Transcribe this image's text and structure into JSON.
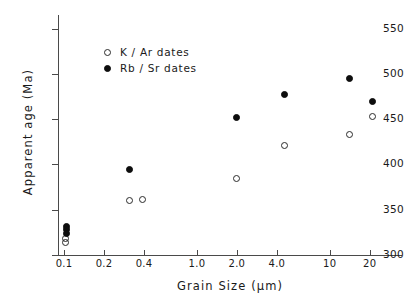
{
  "chart_data": {
    "type": "scatter",
    "title": "",
    "xlabel": "Grain Size (µm)",
    "ylabel": "Apparent age (Ma)",
    "xscale": "log",
    "yscale": "linear",
    "xlim": [
      0.09,
      35
    ],
    "ylim": [
      300,
      565
    ],
    "grid": false,
    "legend_position": "upper left",
    "xticks": [
      {
        "value": 0.1,
        "label": "0.1"
      },
      {
        "value": 0.2,
        "label": "0.2"
      },
      {
        "value": 0.4,
        "label": "0.4"
      },
      {
        "value": 1.0,
        "label": "1.0"
      },
      {
        "value": 2.0,
        "label": "2.0"
      },
      {
        "value": 4.0,
        "label": "4.0"
      },
      {
        "value": 10,
        "label": "10"
      },
      {
        "value": 20,
        "label": "20"
      }
    ],
    "yticks": [
      {
        "value": 300,
        "label": "300"
      },
      {
        "value": 350,
        "label": "350"
      },
      {
        "value": 400,
        "label": "400"
      },
      {
        "value": 450,
        "label": "450"
      },
      {
        "value": 500,
        "label": "500"
      },
      {
        "value": 550,
        "label": "550"
      }
    ],
    "series": [
      {
        "name": "K / Ar dates",
        "marker": "open-circle",
        "color": "#2b2b2b",
        "points": [
          {
            "x": 0.103,
            "y": 318
          },
          {
            "x": 0.103,
            "y": 314
          },
          {
            "x": 0.31,
            "y": 360
          },
          {
            "x": 0.39,
            "y": 361
          },
          {
            "x": 2.0,
            "y": 384
          },
          {
            "x": 4.6,
            "y": 421
          },
          {
            "x": 14.0,
            "y": 433
          },
          {
            "x": 21.0,
            "y": 453
          }
        ]
      },
      {
        "name": "Rb / Sr dates",
        "marker": "filled-circle",
        "color": "#0d0d0d",
        "points": [
          {
            "x": 0.105,
            "y": 332
          },
          {
            "x": 0.105,
            "y": 328
          },
          {
            "x": 0.105,
            "y": 324
          },
          {
            "x": 0.31,
            "y": 394
          },
          {
            "x": 2.0,
            "y": 452
          },
          {
            "x": 4.6,
            "y": 477
          },
          {
            "x": 14.0,
            "y": 495
          },
          {
            "x": 21.0,
            "y": 470
          }
        ]
      }
    ]
  },
  "legend": {
    "items": [
      {
        "label": "K / Ar dates",
        "marker": "open-circle"
      },
      {
        "label": "Rb / Sr dates",
        "marker": "filled-circle"
      }
    ]
  }
}
